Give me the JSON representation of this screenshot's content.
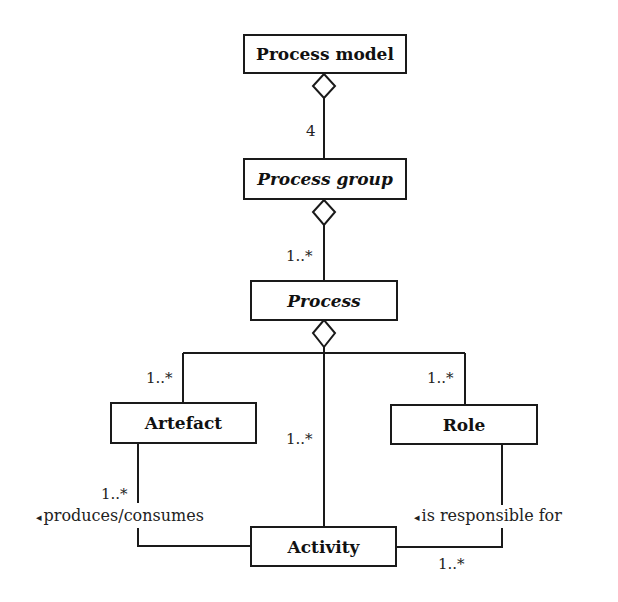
{
  "diagram": {
    "type": "UML class diagram",
    "classes": {
      "process_model": {
        "label": "Process model",
        "italic": false
      },
      "process_group": {
        "label": "Process group",
        "italic": true
      },
      "process": {
        "label": "Process",
        "italic": true
      },
      "artefact": {
        "label": "Artefact",
        "italic": false
      },
      "role": {
        "label": "Role",
        "italic": false
      },
      "activity": {
        "label": "Activity",
        "italic": false
      }
    },
    "multiplicities": {
      "model_group": "4",
      "group_process": "1..*",
      "process_artefact": "1..*",
      "process_activity": "1..*",
      "process_role": "1..*",
      "artefact_activity": "1..*",
      "role_activity": "1..*"
    },
    "associations": {
      "produces_consumes": {
        "arrow": "◂",
        "text": "produces/consumes"
      },
      "is_responsible_for": {
        "arrow": "◂",
        "text": "is responsible for"
      }
    }
  }
}
